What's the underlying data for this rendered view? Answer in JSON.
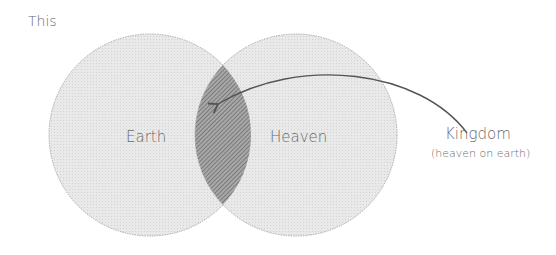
{
  "title": "This",
  "diagram": {
    "type": "venn",
    "sets": [
      {
        "label": "Earth"
      },
      {
        "label": "Heaven"
      }
    ],
    "intersection": {
      "label": "Kingdom",
      "sublabel": "(heaven on earth)"
    }
  },
  "colors": {
    "circle_fill": "#e6e6e6",
    "intersection_fill": "#9a9a9a",
    "stroke": "#8a8a8a",
    "text": "#6a6a6a",
    "arrow": "#555555"
  }
}
